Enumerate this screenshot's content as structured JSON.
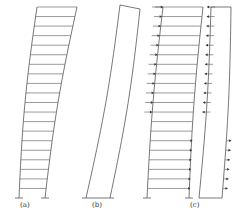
{
  "diagram": {
    "panels": [
      {
        "id": "a",
        "label": "(a)",
        "type": "shear-frame-deformation",
        "stories": 20
      },
      {
        "id": "b",
        "label": "(b)",
        "type": "wall-flexural-deformation"
      },
      {
        "id": "c",
        "label": "(c)",
        "type": "frame-wall-interaction",
        "stories": 20,
        "arrows": {
          "frame_upper": "right-pointing on left edge",
          "wall_upper": "left-pointing",
          "frame_lower": "right-pointing on right edge",
          "wall_lower": "right-pointing"
        }
      }
    ],
    "colors": {
      "line": "#555555",
      "background": "#ffffff"
    }
  }
}
